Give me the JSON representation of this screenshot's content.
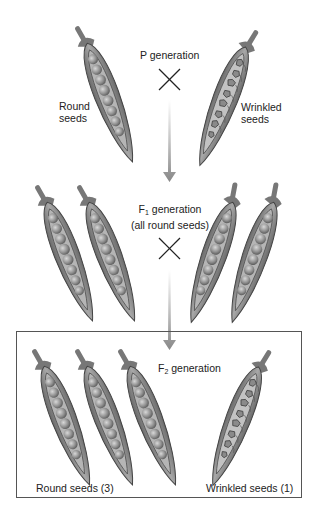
{
  "diagram": {
    "p_generation": {
      "label": "P generation",
      "left_parent": {
        "label": "Round seeds",
        "line1": "Round",
        "line2": "seeds",
        "phenotype": "round"
      },
      "right_parent": {
        "label": "Wrinkled seeds",
        "line1": "Wrinkled",
        "line2": "seeds",
        "phenotype": "wrinkled"
      },
      "cross_symbol": "×"
    },
    "f1_generation": {
      "label_prefix": "F",
      "label_sub": "1",
      "label_suffix": " generation",
      "note": "(all round seeds)",
      "pods": 4,
      "cross_symbol": "×"
    },
    "f2_generation": {
      "label_prefix": "F",
      "label_sub": "2",
      "label_suffix": " generation",
      "round_label": "Round seeds (3)",
      "wrinkled_label": "Wrinkled seeds (1)",
      "round_count": 3,
      "wrinkled_count": 1
    },
    "colors": {
      "pod": "#8a8a8a",
      "pod_dark": "#555555",
      "pea": "#9a9a9a",
      "arrow": "#8c8c8c",
      "box_border": "#555555"
    }
  }
}
